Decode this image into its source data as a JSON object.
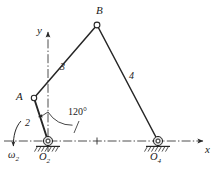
{
  "figure": {
    "type": "kinematic-linkage-diagram",
    "line_color": "#262626",
    "centerline_color": "#3a3a3a",
    "background": "#ffffff"
  },
  "axes": {
    "x_label": "x",
    "y_label": "y",
    "x_axis_style": "dash-dot",
    "y_axis_style": "dash-dot"
  },
  "joints": [
    {
      "id": "A",
      "label": "A",
      "x": 34,
      "y": 98,
      "kind": "pin"
    },
    {
      "id": "B",
      "label": "B",
      "x": 97,
      "y": 25,
      "kind": "pin"
    },
    {
      "id": "O2",
      "label": "O",
      "sub": "2",
      "x": 48,
      "y": 141,
      "kind": "ground-pivot"
    },
    {
      "id": "O4",
      "label": "O",
      "sub": "4",
      "x": 158,
      "y": 141,
      "kind": "ground-pivot"
    }
  ],
  "links": [
    {
      "id": "link2",
      "label": "2",
      "from": "O2",
      "to": "A"
    },
    {
      "id": "link3",
      "label": "3",
      "from": "A",
      "to": "B"
    },
    {
      "id": "link4",
      "label": "4",
      "from": "B",
      "to": "O4"
    }
  ],
  "annotations": {
    "angle": {
      "label": "120°",
      "value": 120,
      "unit": "deg",
      "at_joint": "O2",
      "measured_from": "y-axis"
    },
    "input_velocity": {
      "label": "ω",
      "sub": "2",
      "direction": "clockwise",
      "arrow": "down"
    }
  }
}
